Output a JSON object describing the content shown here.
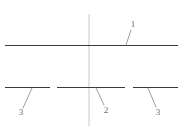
{
  "figure": {
    "background_color": "#ffffff",
    "width": 187,
    "height": 130,
    "line_color": "#3a3a3c",
    "centerline_color": "#c8c8cc",
    "leader_color": "#8d8d92",
    "label_color": "#6e6e72"
  },
  "centerline": {
    "name": "vertical-centerline",
    "x": 89,
    "y1": 14,
    "y2": 126
  },
  "upper_member": {
    "name": "upper-horizontal-member",
    "y": 45.5,
    "x1": 5,
    "x2": 178
  },
  "lower_members": [
    {
      "name": "lower-left-segment",
      "y": 87.5,
      "x1": 5,
      "x2": 50
    },
    {
      "name": "lower-center-segment",
      "y": 87.5,
      "x1": 57,
      "x2": 125
    },
    {
      "name": "lower-right-segment",
      "y": 87.5,
      "x1": 133,
      "x2": 178
    }
  ],
  "callouts": [
    {
      "id": "callout-1",
      "label": "1",
      "label_x": 133,
      "label_y": 27,
      "leader": {
        "x1": 131,
        "y1": 30,
        "x2": 126,
        "y2": 45
      }
    },
    {
      "id": "callout-3-left",
      "label": "3",
      "label_x": 21,
      "label_y": 115,
      "leader": {
        "x1": 23,
        "y1": 108,
        "x2": 32,
        "y2": 88
      }
    },
    {
      "id": "callout-2-center",
      "label": "2",
      "label_x": 106,
      "label_y": 113,
      "leader": {
        "x1": 104,
        "y1": 105,
        "x2": 96,
        "y2": 88
      }
    },
    {
      "id": "callout-3-right",
      "label": "3",
      "label_x": 158,
      "label_y": 115,
      "leader": {
        "x1": 156,
        "y1": 107,
        "x2": 148,
        "y2": 88
      }
    }
  ]
}
